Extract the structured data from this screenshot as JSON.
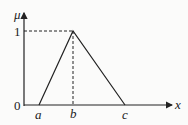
{
  "diagram": {
    "y_axis_label": "μ",
    "x_axis_label": "x",
    "y_ticks": [
      "1",
      "0"
    ],
    "x_points": [
      "a",
      "b",
      "c"
    ],
    "colors": {
      "line": "#222222",
      "background": "#fbfbfa"
    }
  }
}
